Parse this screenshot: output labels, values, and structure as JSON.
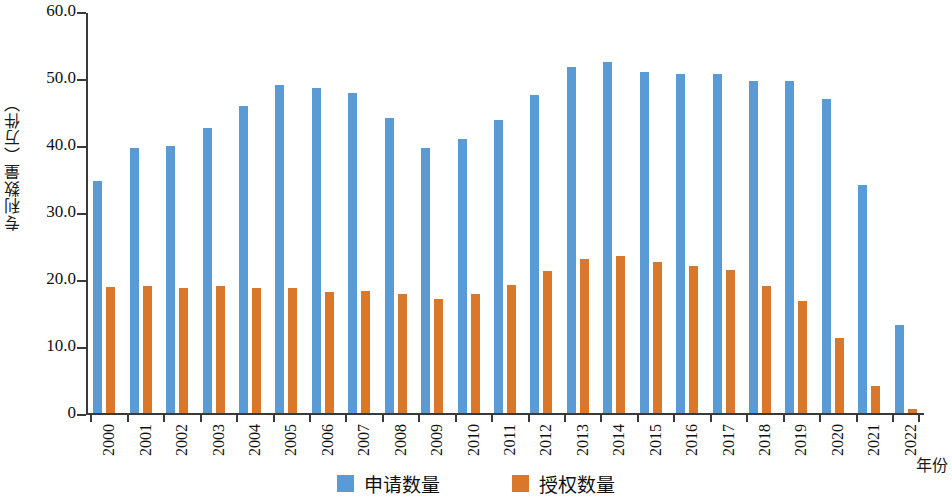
{
  "chart_data": {
    "type": "bar",
    "title": "",
    "xlabel": "年份",
    "ylabel": "专利数量（万件）",
    "ylim": [
      0,
      60
    ],
    "yticks": [
      0,
      10,
      20,
      30,
      40,
      50,
      60
    ],
    "ytick_labels": [
      "0",
      "10.0",
      "20.0",
      "30.0",
      "40.0",
      "50.0",
      "60.0"
    ],
    "grid": false,
    "legend_position": "bottom",
    "categories": [
      "2000",
      "2001",
      "2002",
      "2003",
      "2004",
      "2005",
      "2006",
      "2007",
      "2008",
      "2009",
      "2010",
      "2011",
      "2012",
      "2013",
      "2014",
      "2015",
      "2016",
      "2017",
      "2018",
      "2019",
      "2020",
      "2021",
      "2022"
    ],
    "series": [
      {
        "name": "申请数量",
        "color": "#5B9BD5",
        "values": [
          34.6,
          39.5,
          39.9,
          42.6,
          45.8,
          48.9,
          48.5,
          47.8,
          44.0,
          39.6,
          40.9,
          43.7,
          47.4,
          51.7,
          52.4,
          50.9,
          50.6,
          50.6,
          49.5,
          49.6,
          46.9,
          34.1,
          13.2
        ]
      },
      {
        "name": "授权数量",
        "color": "#D9772B",
        "values": [
          18.8,
          18.9,
          18.7,
          18.9,
          18.7,
          18.6,
          18.1,
          18.2,
          17.7,
          17.0,
          17.8,
          19.1,
          21.2,
          23.0,
          23.4,
          22.5,
          21.9,
          21.4,
          18.9,
          16.7,
          11.2,
          4.0,
          0.6
        ]
      }
    ]
  },
  "legend": {
    "items": [
      {
        "label": "申请数量",
        "color": "#5B9BD5",
        "swatch_name": "legend-swatch-blue"
      },
      {
        "label": "授权数量",
        "color": "#D9772B",
        "swatch_name": "legend-swatch-orange"
      }
    ]
  },
  "axes": {
    "y_title": "专利数量（万件）",
    "x_title": "年份"
  }
}
